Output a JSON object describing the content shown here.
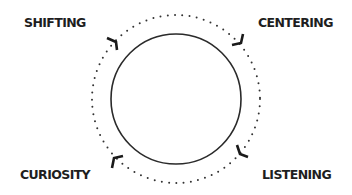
{
  "diagram": {
    "type": "cycle",
    "labels": {
      "top_left": "SHIFTING",
      "top_right": "CENTERING",
      "bottom_left": "CURIOSITY",
      "bottom_right": "LISTENING"
    },
    "inner_circle": {
      "cx": 176,
      "cy": 99,
      "r": 65,
      "stroke": "#2a2a2a"
    },
    "outer_ring": {
      "cx": 176,
      "cy": 99,
      "r": 84,
      "style": "dotted",
      "color": "#333333"
    },
    "arrow_color": "#1a1a1a",
    "background": "#ffffff"
  }
}
